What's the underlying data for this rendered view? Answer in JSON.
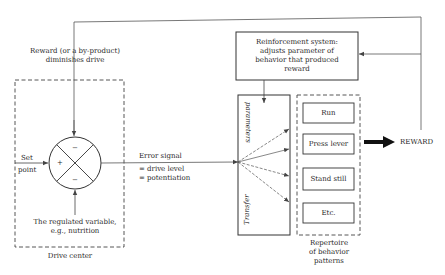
{
  "diagram": {
    "feedback_label_line1": "Reward (or a by-product)",
    "feedback_label_line2": "diminishes drive",
    "set_point_line1": "Set",
    "set_point_line2": "point",
    "comparator_signs": {
      "left": "+",
      "top": "−",
      "bottom": "−"
    },
    "regulated_variable_line1": "The regulated variable,",
    "regulated_variable_line2": "e.g., nutrition",
    "drive_center_label": "Drive center",
    "error_signal_title": "Error signal",
    "error_signal_line1": "= drive level",
    "error_signal_line2": "= potentiation",
    "transfer_box_top": "parameters",
    "transfer_box_bottom": "Transfer",
    "reinforcement_line1": "Reinforcement system:",
    "reinforcement_line2": "adjusts parameter of",
    "reinforcement_line3": "behavior that produced",
    "reinforcement_line4": "reward",
    "behaviors": [
      "Run",
      "Press lever",
      "Stand still",
      "Etc."
    ],
    "repertoire_line1": "Repertoire",
    "repertoire_line2": "of behavior",
    "repertoire_line3": "patterns",
    "reward_label": "REWARD",
    "colors": {
      "line": "#444444",
      "text": "#2a2a2a",
      "background": "#ffffff"
    }
  }
}
